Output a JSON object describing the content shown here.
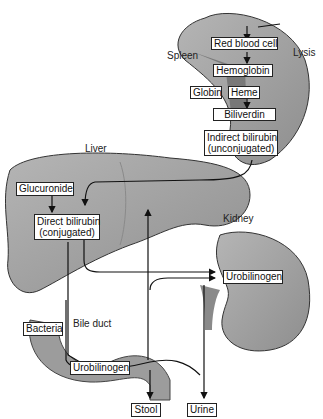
{
  "organs": {
    "spleen": "Spleen",
    "liver": "Liver",
    "kidney": "Kidney",
    "bile_duct": "Bile duct",
    "lysis": "Lysis"
  },
  "boxes": {
    "red_blood_cell": "Red blood cell",
    "hemoglobin": "Hemoglobin",
    "globin": "Globin",
    "heme": "Heme",
    "biliverdin": "Biliverdin",
    "indirect_bilirubin_1": "Indirect bilirubin",
    "indirect_bilirubin_2": "(unconjugated)",
    "glucuronide": "Glucuronide",
    "direct_bilirubin_1": "Direct bilirubin",
    "direct_bilirubin_2": "(conjugated)",
    "urobilinogen_kidney": "Urobilinogen",
    "bacteria": "Bacteria",
    "urobilinogen_gut": "Urobilinogen",
    "stool": "Stool",
    "urine": "Urine"
  }
}
